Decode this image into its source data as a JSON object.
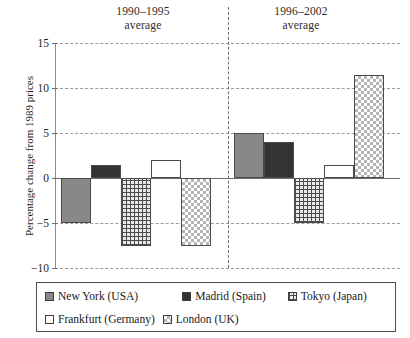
{
  "chart_data": {
    "type": "bar",
    "title": "",
    "xlabel": "",
    "ylabel": "Percentage change from 1989 prices",
    "ylim": [
      -10,
      15
    ],
    "yticks": [
      15,
      10,
      5,
      0,
      -5,
      -10
    ],
    "ytick_labels": [
      "15",
      "10",
      "5",
      "0",
      "−5",
      "−10"
    ],
    "grid": true,
    "legend_position": "bottom",
    "categories": [
      "1990–1995\naverage",
      "1996–2002\naverage"
    ],
    "group_titles": [
      {
        "line1": "1990–1995",
        "line2": "average"
      },
      {
        "line1": "1996–2002",
        "line2": "average"
      }
    ],
    "series": [
      {
        "name": "New York (USA)",
        "pattern": "solid-grey",
        "color": "#888888",
        "values": [
          -5.0,
          5.0
        ]
      },
      {
        "name": "Madrid (Spain)",
        "pattern": "solid-dark",
        "color": "#333333",
        "values": [
          1.5,
          4.0
        ]
      },
      {
        "name": "Tokyo (Japan)",
        "pattern": "grid-hatch",
        "color": "#4c4c4c",
        "values": [
          -7.5,
          -5.0
        ]
      },
      {
        "name": "Frankfurt (Germany)",
        "pattern": "open-white",
        "color": "#ffffff",
        "values": [
          2.0,
          1.5
        ]
      },
      {
        "name": "London (UK)",
        "pattern": "checker",
        "color": "#b5b5b5",
        "values": [
          -7.5,
          11.5
        ]
      }
    ]
  },
  "axis": {
    "y_label": "Percentage change from 1989 prices",
    "ticks": [
      {
        "label": "15",
        "value": 15
      },
      {
        "label": "10",
        "value": 10
      },
      {
        "label": "5",
        "value": 5
      },
      {
        "label": "0",
        "value": 0
      },
      {
        "label": "−5",
        "value": -5
      },
      {
        "label": "−10",
        "value": -10
      }
    ]
  },
  "legend": {
    "items": [
      {
        "label": "New York (USA)",
        "swatch": "solid-grey-swatch"
      },
      {
        "label": "Madrid (Spain)",
        "swatch": "solid-dark-swatch"
      },
      {
        "label": "Tokyo (Japan)",
        "swatch": "grid-hatch-swatch"
      },
      {
        "label": "Frankfurt (Germany)",
        "swatch": "open-white-swatch"
      },
      {
        "label": "London (UK)",
        "swatch": "checker-swatch"
      }
    ]
  }
}
